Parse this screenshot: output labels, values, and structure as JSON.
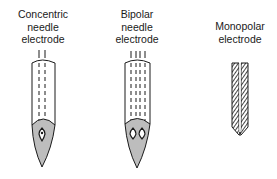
{
  "diagram": {
    "electrodes": [
      {
        "id": "concentric",
        "label_lines": [
          "Concentric",
          "needle",
          "electrode"
        ]
      },
      {
        "id": "bipolar",
        "label_lines": [
          "Bipolar",
          "needle",
          "electrode"
        ]
      },
      {
        "id": "monopolar",
        "label_lines": [
          "Monopolar",
          "electrode"
        ]
      }
    ],
    "colors": {
      "outline": "#1a1a1a",
      "tip_fill": "#bdbdbd",
      "background": "#ffffff"
    }
  }
}
